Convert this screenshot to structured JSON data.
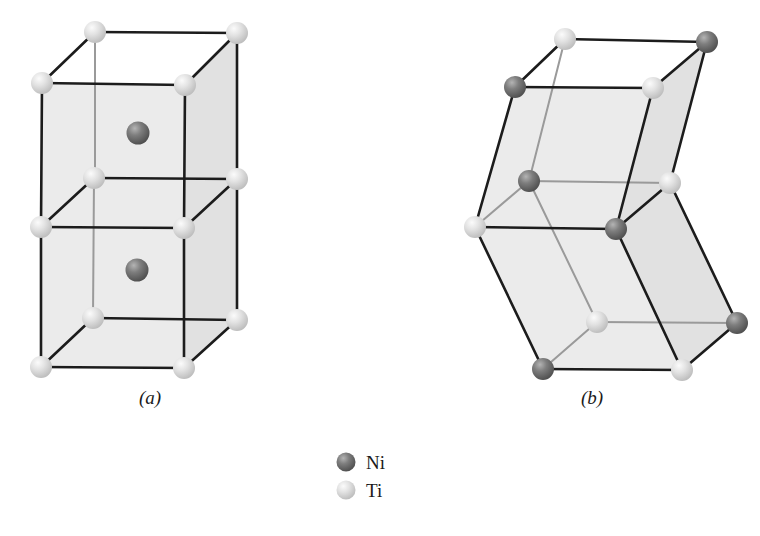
{
  "figure": {
    "type": "crystal-structure-diagram",
    "background_color": "#ffffff",
    "panels": [
      {
        "id": "a",
        "label": "(a)",
        "label_x": 150,
        "label_y": 404,
        "description": "Austenite body-centred cubic unit cells stacked vertically, Ti at corners, Ni at body centre"
      },
      {
        "id": "b",
        "label": "(b)",
        "label_x": 592,
        "label_y": 404,
        "description": "Martensite sheared monoclinic unit cell with alternating Ni and Ti atoms at vertices"
      }
    ]
  },
  "legend": {
    "items": [
      {
        "label": "Ni",
        "color": "#6b6b6b",
        "highlight": "#b4b4b4",
        "cx": 346,
        "cy": 462,
        "r": 9.5,
        "text_x": 366,
        "text_y": 469
      },
      {
        "label": "Ti",
        "color": "#dcdcdc",
        "highlight": "#f7f7f7",
        "cx": 346,
        "cy": 490,
        "r": 9.5,
        "text_x": 366,
        "text_y": 497
      }
    ]
  },
  "colors": {
    "ni_sphere": "#6b6b6b",
    "ni_highlight": "#b4b4b4",
    "ni_shadow": "#4a4a4a",
    "ti_sphere": "#dcdcdc",
    "ti_highlight": "#f8f8f8",
    "ti_shadow": "#b8b8b8",
    "edge_front": "#1c1c1c",
    "edge_back": "#9a9a9a",
    "face_fill": "#e8e8e8",
    "text": "#1a1a1a"
  },
  "panel_a": {
    "vertices": {
      "top_back_left": {
        "x": 95,
        "y": 32,
        "element": "Ti"
      },
      "top_back_right": {
        "x": 237,
        "y": 33,
        "element": "Ti"
      },
      "top_front_left": {
        "x": 42,
        "y": 83,
        "element": "Ti"
      },
      "top_front_right": {
        "x": 185,
        "y": 85,
        "element": "Ti"
      },
      "mid_back_left": {
        "x": 94,
        "y": 178,
        "element": "Ti"
      },
      "mid_back_right": {
        "x": 237,
        "y": 179,
        "element": "Ti"
      },
      "mid_front_left": {
        "x": 41,
        "y": 227,
        "element": "Ti"
      },
      "mid_front_right": {
        "x": 184,
        "y": 228,
        "element": "Ti"
      },
      "bot_back_left": {
        "x": 93,
        "y": 318,
        "element": "Ti"
      },
      "bot_back_right": {
        "x": 237,
        "y": 320,
        "element": "Ti"
      },
      "bot_front_left": {
        "x": 41,
        "y": 367,
        "element": "Ti"
      },
      "bot_front_right": {
        "x": 184,
        "y": 368,
        "element": "Ti"
      }
    },
    "centre_atoms": [
      {
        "x": 138,
        "y": 133,
        "element": "Ni"
      },
      {
        "x": 137,
        "y": 270,
        "element": "Ni"
      }
    ],
    "sphere_radius_corner": 11,
    "sphere_radius_centre": 11.5
  },
  "panel_b": {
    "vertices": {
      "top_back_left": {
        "x": 565,
        "y": 39,
        "element": "Ti"
      },
      "top_back_right": {
        "x": 707,
        "y": 42,
        "element": "Ni"
      },
      "top_front_left": {
        "x": 515,
        "y": 87,
        "element": "Ni"
      },
      "top_front_right": {
        "x": 653,
        "y": 88,
        "element": "Ti"
      },
      "mid_back_left": {
        "x": 529,
        "y": 181,
        "element": "Ni"
      },
      "mid_back_right": {
        "x": 670,
        "y": 183,
        "element": "Ti"
      },
      "mid_front_left": {
        "x": 475,
        "y": 227,
        "element": "Ti"
      },
      "mid_front_right": {
        "x": 616,
        "y": 229,
        "element": "Ni"
      },
      "bot_back_left": {
        "x": 597,
        "y": 322,
        "element": "Ti"
      },
      "bot_back_right": {
        "x": 737,
        "y": 323,
        "element": "Ni"
      },
      "bot_front_left": {
        "x": 543,
        "y": 369,
        "element": "Ni"
      },
      "bot_front_right": {
        "x": 682,
        "y": 370,
        "element": "Ti"
      }
    },
    "sphere_radius_corner": 11
  }
}
